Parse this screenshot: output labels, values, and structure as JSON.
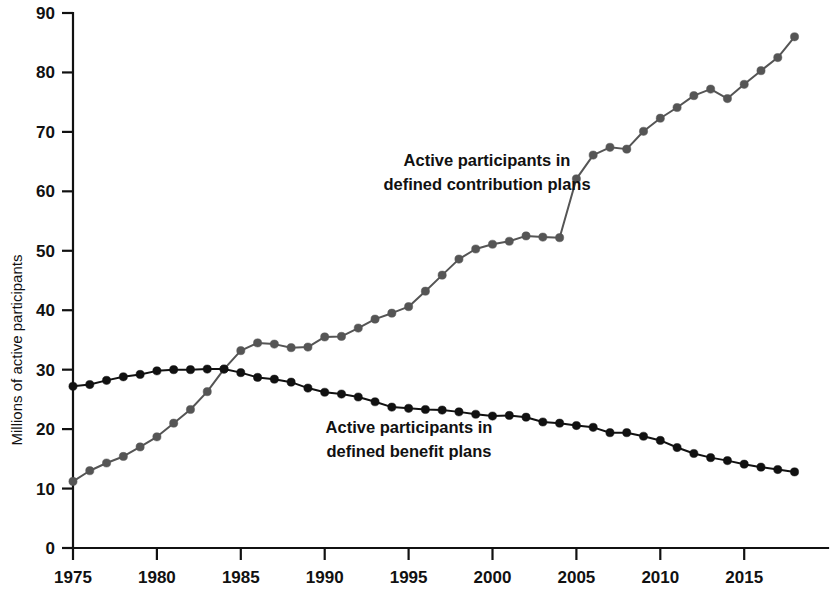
{
  "chart_data": {
    "type": "line",
    "title": "",
    "xlabel": "",
    "ylabel": "Millions of active participants",
    "xlim": [
      1975,
      2018
    ],
    "ylim": [
      0,
      90
    ],
    "grid": false,
    "legend_position": "inline-annotations",
    "x_tick_labels": [
      "1975",
      "1980",
      "1985",
      "1990",
      "1995",
      "2000",
      "2005",
      "2010",
      "2015"
    ],
    "x_ticks": [
      1975,
      1980,
      1985,
      1990,
      1995,
      2000,
      2005,
      2010,
      2015
    ],
    "y_tick_labels": [
      "0",
      "10",
      "20",
      "30",
      "40",
      "50",
      "60",
      "70",
      "80",
      "90"
    ],
    "y_ticks": [
      0,
      10,
      20,
      30,
      40,
      50,
      60,
      70,
      80,
      90
    ],
    "x": [
      1975,
      1976,
      1977,
      1978,
      1979,
      1980,
      1981,
      1982,
      1983,
      1984,
      1985,
      1986,
      1987,
      1988,
      1989,
      1990,
      1991,
      1992,
      1993,
      1994,
      1995,
      1996,
      1997,
      1998,
      1999,
      2000,
      2001,
      2002,
      2003,
      2004,
      2005,
      2006,
      2007,
      2008,
      2009,
      2010,
      2011,
      2012,
      2013,
      2014,
      2015,
      2016,
      2017,
      2018
    ],
    "series": [
      {
        "name": "Active participants in defined contribution plans",
        "color": "#555555",
        "marker": "circle",
        "values": [
          11.2,
          13.0,
          14.3,
          15.4,
          17.0,
          18.7,
          21.0,
          23.3,
          26.3,
          30.1,
          33.2,
          34.5,
          34.3,
          33.7,
          33.8,
          35.5,
          35.6,
          37.0,
          38.5,
          39.5,
          40.6,
          43.2,
          45.9,
          48.6,
          50.3,
          51.1,
          51.6,
          52.5,
          52.3,
          52.2,
          62.1,
          66.1,
          67.4,
          67.1,
          70.1,
          72.3,
          74.1,
          76.1,
          77.2,
          75.6,
          78.0,
          80.3,
          82.5,
          86.0
        ]
      },
      {
        "name": "Active participants in defined benefit plans",
        "color": "#111111",
        "marker": "circle",
        "values": [
          27.2,
          27.5,
          28.2,
          28.8,
          29.2,
          29.8,
          30.0,
          30.0,
          30.1,
          30.1,
          29.5,
          28.7,
          28.4,
          27.9,
          26.9,
          26.2,
          25.9,
          25.4,
          24.6,
          23.7,
          23.5,
          23.3,
          23.2,
          22.9,
          22.5,
          22.2,
          22.3,
          22.0,
          21.2,
          21.0,
          20.6,
          20.3,
          19.4,
          19.4,
          18.8,
          18.1,
          16.9,
          15.9,
          15.2,
          14.7,
          14.1,
          13.6,
          13.2,
          12.8
        ]
      }
    ],
    "annotations": [
      {
        "name": "defined-contribution-annotation",
        "lines": [
          "Active participants in",
          "defined contribution plans"
        ],
        "x": 487,
        "y": 166
      },
      {
        "name": "defined-benefit-annotation",
        "lines": [
          "Active participants in",
          "defined benefit plans"
        ],
        "x": 409,
        "y": 433
      }
    ]
  }
}
